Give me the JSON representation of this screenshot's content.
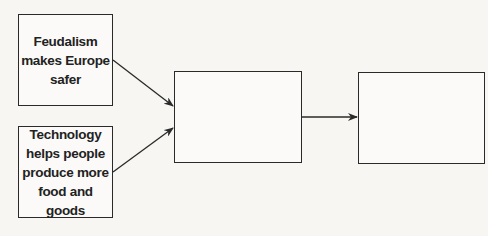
{
  "diagram": {
    "type": "cause-effect flowchart",
    "boxes": [
      {
        "id": "cause-1",
        "text": "Feudalism\nmakes Europe\nsafer"
      },
      {
        "id": "cause-2",
        "text": "Technology\nhelps people\nproduce more\nfood and goods"
      },
      {
        "id": "effect-1",
        "text": ""
      },
      {
        "id": "effect-2",
        "text": ""
      }
    ],
    "arrows": [
      {
        "from": "cause-1",
        "to": "effect-1"
      },
      {
        "from": "cause-2",
        "to": "effect-1"
      },
      {
        "from": "effect-1",
        "to": "effect-2"
      }
    ],
    "colors": {
      "line": "#2a2a2a",
      "background": "#f7f6f3"
    }
  }
}
